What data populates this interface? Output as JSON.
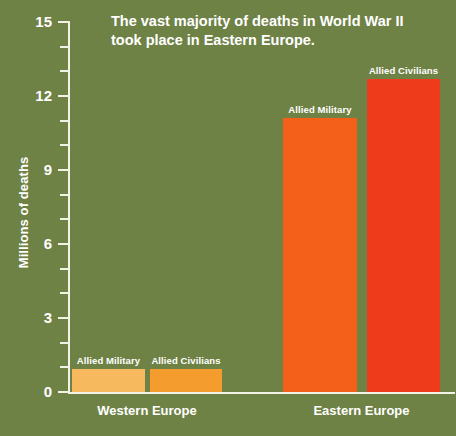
{
  "chart_data": {
    "type": "bar",
    "title": "The vast majority of deaths in World War II took place in Eastern Europe.",
    "title_line1": "The vast majority of deaths in World War II",
    "title_line2": "took place in Eastern Europe.",
    "xlabel": "",
    "ylabel": "Millions of deaths",
    "ylim": [
      0,
      15
    ],
    "ytick_labels": [
      "0",
      "3",
      "6",
      "9",
      "12",
      "15"
    ],
    "ytick_values": [
      0,
      3,
      6,
      9,
      12,
      15
    ],
    "minor_tick_step": 1,
    "grid": false,
    "legend": "none",
    "categories": [
      "Western Europe",
      "Eastern Europe"
    ],
    "series": [
      {
        "name": "Allied Military",
        "values": [
          0.93,
          11.1
        ]
      },
      {
        "name": "Allied Civilians",
        "values": [
          0.93,
          12.7
        ]
      }
    ],
    "bars": [
      {
        "group": "Western Europe",
        "label": "Allied Military",
        "value": 0.93,
        "color": "#f6b95e"
      },
      {
        "group": "Western Europe",
        "label": "Allied Civilians",
        "value": 0.93,
        "color": "#f59c2e"
      },
      {
        "group": "Eastern Europe",
        "label": "Allied Military",
        "value": 11.1,
        "color": "#f4601a"
      },
      {
        "group": "Eastern Europe",
        "label": "Allied Civilians",
        "value": 12.7,
        "color": "#ee3b1c"
      }
    ],
    "colors": {
      "background": "#6f8246",
      "axis": "#f2f3e6",
      "text": "#ffffff"
    }
  }
}
